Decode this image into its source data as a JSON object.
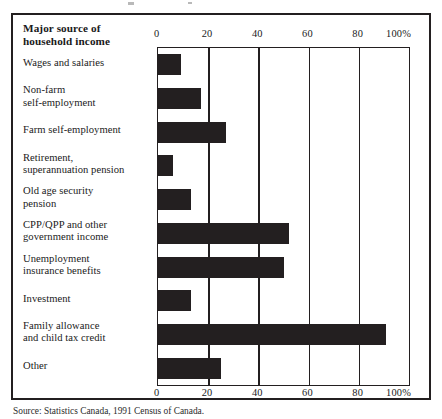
{
  "figure": {
    "column_header": "Major source of\nhousehold income",
    "column_header_line1": "Major source of",
    "column_header_line2": "household income",
    "source_note": "Source: Statistics Canada, 1991 Census of Canada."
  },
  "axis": {
    "ticks_top": [
      "0",
      "20",
      "40",
      "60",
      "80",
      "100%"
    ],
    "ticks_bottom": [
      "0",
      "20",
      "40",
      "60",
      "80",
      "100%"
    ]
  },
  "colors": {
    "bar": "#231f20",
    "frame": "#231f20",
    "background": "#ffffff",
    "text": "#1a1a1a"
  },
  "chart_data": {
    "type": "bar",
    "orientation": "horizontal",
    "title": "",
    "subtitle": "",
    "xlabel": "",
    "ylabel": "Major source of household income",
    "xlim": [
      0,
      100
    ],
    "xticks": [
      0,
      20,
      40,
      60,
      80,
      100
    ],
    "xtick_labels": [
      "0",
      "20",
      "40",
      "60",
      "80",
      "100%"
    ],
    "grid": true,
    "grid_axis": "x",
    "legend": false,
    "units": "percent",
    "categories": [
      "Wages and salaries",
      "Non-farm self-employment",
      "Farm self-employment",
      "Retirement, superannuation pension",
      "Old age security pension",
      "CPP/QPP and other government income",
      "Unemployment insurance benefits",
      "Investment",
      "Family allowance and child tax credit",
      "Other"
    ],
    "category_lines": [
      [
        "Wages and salaries"
      ],
      [
        "Non-farm",
        "self-employment"
      ],
      [
        "Farm self-employment"
      ],
      [
        "Retirement,",
        "superannuation pension"
      ],
      [
        "Old age security",
        "pension"
      ],
      [
        "CPP/QPP and other",
        "government income"
      ],
      [
        "Unemployment",
        "insurance benefits"
      ],
      [
        "Investment"
      ],
      [
        "Family allowance",
        "and child tax credit"
      ],
      [
        "Other"
      ]
    ],
    "values": [
      9,
      17,
      27,
      6,
      13,
      52,
      50,
      13,
      91,
      25
    ]
  }
}
